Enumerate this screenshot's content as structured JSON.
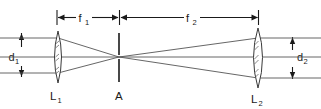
{
  "diagram": {
    "background_color": "#ffffff",
    "line_color": "#4a4a4a",
    "label_color": "#1a1a1a",
    "labels": {
      "f1_base": "f",
      "f1_sub": "1",
      "f2_base": "f",
      "f2_sub": "2",
      "d1_base": "d",
      "d1_sub": "1",
      "d2_base": "d",
      "d2_sub": "2",
      "lens1_base": "L",
      "lens1_sub": "1",
      "lens2_base": "L",
      "lens2_sub": "2",
      "aperture": "A"
    },
    "components": [
      {
        "name": "lens-1",
        "label": "L1",
        "type": "biconvex-lens",
        "center_x": 58,
        "center_y": 57,
        "half_height": 26,
        "half_width": 6
      },
      {
        "name": "aperture",
        "label": "A",
        "type": "pinhole-aperture",
        "center_x": 119,
        "top_y": 33,
        "bottom_y": 82
      },
      {
        "name": "lens-2",
        "label": "L2",
        "type": "biconvex-lens",
        "center_x": 258,
        "center_y": 57,
        "half_height": 30,
        "half_width": 8
      }
    ],
    "dimensions": [
      {
        "name": "f1",
        "label": "f1",
        "orientation": "horizontal",
        "from_x": 57,
        "to_x": 119,
        "y": 17,
        "meaning": "focal-length-lens-1"
      },
      {
        "name": "f2",
        "label": "f2",
        "orientation": "horizontal",
        "from_x": 121,
        "to_x": 258,
        "y": 17,
        "meaning": "focal-length-lens-2"
      },
      {
        "name": "d1",
        "label": "d1",
        "orientation": "vertical",
        "x": 21,
        "from_y": 33,
        "to_y": 77,
        "meaning": "input-beam-diameter"
      },
      {
        "name": "d2",
        "label": "d2",
        "orientation": "vertical",
        "x": 292,
        "from_y": 37,
        "to_y": 79,
        "meaning": "output-beam-diameter"
      }
    ],
    "rays": {
      "input_y_values": [
        38,
        57,
        73
      ],
      "input_from_x": 0,
      "input_to_x": 58,
      "focus_x": 119,
      "focus_y": 57,
      "output_y_values": [
        38,
        57,
        78
      ],
      "output_to_x": 321
    }
  }
}
